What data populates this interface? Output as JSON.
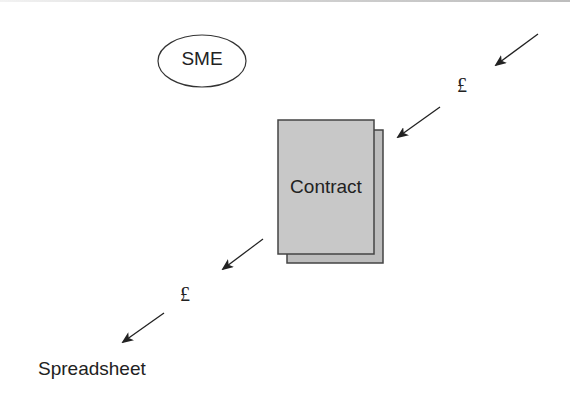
{
  "diagram": {
    "type": "flow",
    "nodes": {
      "sme": {
        "label": "SME",
        "shape": "ellipse"
      },
      "contract": {
        "label": "Contract",
        "shape": "stacked-document",
        "fill": "#c8c8c8",
        "stroke": "#444444"
      },
      "spreadsheet": {
        "label": "Spreadsheet",
        "shape": "text"
      }
    },
    "flows": [
      {
        "label": "£",
        "direction": "into-contract"
      },
      {
        "label": "£",
        "direction": "out-to-spreadsheet"
      }
    ],
    "colors": {
      "line": "#222222",
      "document_fill": "#c8c8c8",
      "document_back_fill": "#bdbdbd"
    }
  }
}
